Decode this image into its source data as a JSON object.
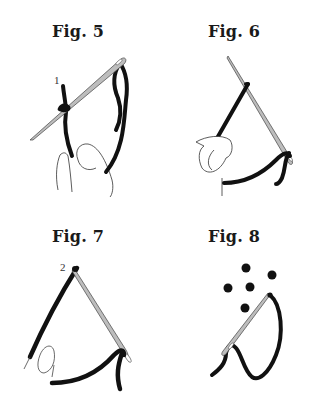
{
  "figures": [
    {
      "id": "fig5",
      "title": "Fig. 5",
      "marker": "1",
      "description": "Needle passes through thread loop at point 1, hand holding thread"
    },
    {
      "id": "fig6",
      "title": "Fig. 6",
      "description": "Thread pulled along needle, hand holding thread"
    },
    {
      "id": "fig7",
      "title": "Fig. 7",
      "marker": "2",
      "description": "Needle inserted at point 2, thread wrapped"
    },
    {
      "id": "fig8",
      "title": "Fig. 8",
      "dots": 5,
      "description": "Needle with thread loop beneath five dots"
    }
  ],
  "colors": {
    "thread": "#111111",
    "needle_fill": "#bdbdbd",
    "needle_stroke": "#444444",
    "hand_stroke": "#333333",
    "dot": "#111111"
  }
}
